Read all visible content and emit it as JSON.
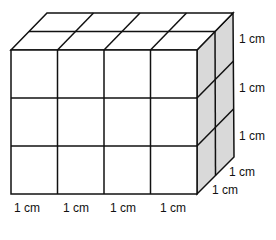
{
  "diagram": {
    "type": "cuboid-of-unit-cubes",
    "dimensions": {
      "length": 4,
      "height": 3,
      "depth": 2
    },
    "colors": {
      "front": "#ffffff",
      "top": "#ffffff",
      "side": "#d9d9d9",
      "stroke": "#111111"
    }
  },
  "labels": {
    "bottom": [
      "1 cm",
      "1 cm",
      "1 cm",
      "1 cm"
    ],
    "right": [
      "1 cm",
      "1 cm",
      "1 cm"
    ],
    "depth": [
      "1 cm",
      "1 cm"
    ]
  }
}
